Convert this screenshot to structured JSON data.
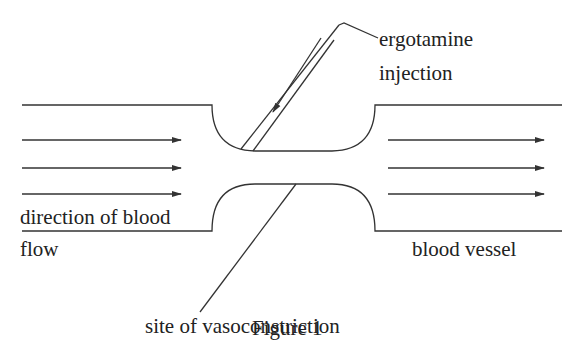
{
  "labels": {
    "injection_line1": "ergotamine",
    "injection_line2": "injection",
    "flow_line1": "direction of blood",
    "flow_line2": "flow",
    "vessel": "blood vessel",
    "site": "site of vasoconstriction",
    "caption": "Figure 1"
  },
  "colors": {
    "line": "#333333",
    "text": "#222222",
    "background": "#ffffff"
  },
  "arrows": {
    "left_rows_y": [
      140,
      168,
      194
    ],
    "right_rows_y": [
      140,
      168,
      194
    ]
  }
}
